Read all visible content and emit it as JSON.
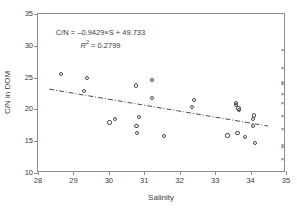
{
  "chart_data": {
    "type": "scatter",
    "title": "",
    "xlabel": "Salinity",
    "ylabel": "C/N in DOM",
    "xlim": [
      28,
      35
    ],
    "ylim": [
      10,
      35
    ],
    "xticks": [
      28,
      29,
      30,
      31,
      32,
      33,
      34,
      35
    ],
    "yticks": [
      10,
      15,
      20,
      25,
      30,
      35
    ],
    "grid": false,
    "legend": null,
    "annotations": {
      "equation": "C/N = –0.9429×S + 49.733",
      "r_squared_label": "R",
      "r_squared_exponent": "2",
      "r_squared_value": "= 0.2799"
    },
    "series": [
      {
        "name": "samples",
        "marker": "open-circle",
        "color": "#4a4a4a",
        "points": [
          [
            28.66,
            25.55
          ],
          [
            29.3,
            22.85
          ],
          [
            29.38,
            24.9
          ],
          [
            30.02,
            17.95
          ],
          [
            30.17,
            18.45
          ],
          [
            30.76,
            23.75
          ],
          [
            30.78,
            17.35
          ],
          [
            30.79,
            16.3
          ],
          [
            30.85,
            18.8
          ],
          [
            31.21,
            24.6
          ],
          [
            31.22,
            21.85
          ],
          [
            31.55,
            15.85
          ],
          [
            32.34,
            20.4
          ],
          [
            32.4,
            21.45
          ],
          [
            33.35,
            15.9
          ],
          [
            33.58,
            21.05
          ],
          [
            33.6,
            20.65
          ],
          [
            33.63,
            16.3
          ],
          [
            33.66,
            20.15
          ],
          [
            33.67,
            19.95
          ],
          [
            33.85,
            15.65
          ],
          [
            34.06,
            17.45
          ],
          [
            34.08,
            18.55
          ],
          [
            34.09,
            19.05
          ],
          [
            34.13,
            14.75
          ]
        ]
      },
      {
        "name": "endmember",
        "marker": "x",
        "color": "#4a4a4a",
        "points": [
          [
            34.9,
            29.3
          ],
          [
            34.9,
            26.5
          ],
          [
            34.9,
            24.2
          ],
          [
            34.9,
            23.95
          ],
          [
            34.9,
            22.4
          ],
          [
            34.9,
            21.0
          ],
          [
            34.9,
            18.85
          ],
          [
            34.9,
            16.85
          ],
          [
            34.9,
            14.3
          ],
          [
            34.9,
            13.95
          ],
          [
            34.9,
            12.2
          ]
        ]
      }
    ],
    "trendline": {
      "style": "dash-dot",
      "color": "#4a4a4a",
      "slope": -0.9429,
      "intercept": 49.733,
      "r_squared": 0.2799,
      "x_start": 28.32,
      "x_end": 34.55
    }
  }
}
